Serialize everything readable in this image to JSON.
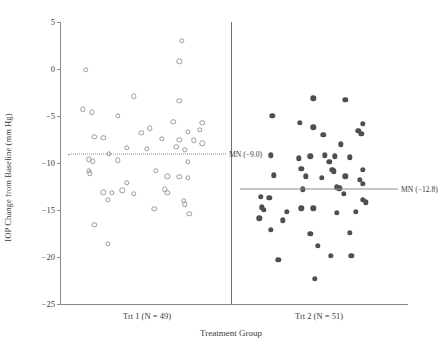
{
  "chart_data": {
    "type": "scatter",
    "title": "",
    "xlabel": "Treatment Group",
    "ylabel": "IOP Change from Baseline (mm Hg)",
    "ylim": [
      -25,
      5
    ],
    "yticks": [
      5,
      0,
      -5,
      -10,
      -15,
      -20,
      -25
    ],
    "ytick_labels": [
      "5",
      "0",
      "−5",
      "−10",
      "−15",
      "−20",
      "−25"
    ],
    "grid": false,
    "legend_position": "none",
    "groups": [
      {
        "name": "Trt 1",
        "label": "Trt 1 (N = 49)",
        "n": 49,
        "marker": "open-circle",
        "marker_color": "#9a9a9a",
        "mean": -9.0,
        "mean_label": "MN (−9.0)",
        "mean_line_style": "dotted",
        "points": [
          {
            "jitter": 0.74,
            "y": 3.0
          },
          {
            "jitter": 0.72,
            "y": 0.8
          },
          {
            "jitter": 0.08,
            "y": -0.1
          },
          {
            "jitter": 0.41,
            "y": -2.9
          },
          {
            "jitter": 0.72,
            "y": -3.4
          },
          {
            "jitter": 0.06,
            "y": -4.3
          },
          {
            "jitter": 0.12,
            "y": -4.6
          },
          {
            "jitter": 0.3,
            "y": -5.0
          },
          {
            "jitter": 0.68,
            "y": -5.6
          },
          {
            "jitter": 0.88,
            "y": -5.7
          },
          {
            "jitter": 0.52,
            "y": -6.3
          },
          {
            "jitter": 0.46,
            "y": -6.8
          },
          {
            "jitter": 0.78,
            "y": -6.7
          },
          {
            "jitter": 0.86,
            "y": -6.5
          },
          {
            "jitter": 0.14,
            "y": -7.2
          },
          {
            "jitter": 0.2,
            "y": -7.3
          },
          {
            "jitter": 0.6,
            "y": -7.4
          },
          {
            "jitter": 0.72,
            "y": -7.5
          },
          {
            "jitter": 0.82,
            "y": -7.6
          },
          {
            "jitter": 0.88,
            "y": -7.9
          },
          {
            "jitter": 0.36,
            "y": -8.4
          },
          {
            "jitter": 0.5,
            "y": -8.5
          },
          {
            "jitter": 0.7,
            "y": -8.3
          },
          {
            "jitter": 0.76,
            "y": -8.6
          },
          {
            "jitter": 0.24,
            "y": -9.0
          },
          {
            "jitter": 0.1,
            "y": -9.6
          },
          {
            "jitter": 0.13,
            "y": -9.8
          },
          {
            "jitter": 0.3,
            "y": -9.7
          },
          {
            "jitter": 0.78,
            "y": -9.9
          },
          {
            "jitter": 0.1,
            "y": -10.8
          },
          {
            "jitter": 0.11,
            "y": -11.1
          },
          {
            "jitter": 0.56,
            "y": -10.8
          },
          {
            "jitter": 0.64,
            "y": -11.4
          },
          {
            "jitter": 0.72,
            "y": -11.5
          },
          {
            "jitter": 0.78,
            "y": -11.6
          },
          {
            "jitter": 0.36,
            "y": -12.1
          },
          {
            "jitter": 0.33,
            "y": -12.9
          },
          {
            "jitter": 0.62,
            "y": -12.8
          },
          {
            "jitter": 0.64,
            "y": -13.2
          },
          {
            "jitter": 0.2,
            "y": -13.1
          },
          {
            "jitter": 0.26,
            "y": -13.2
          },
          {
            "jitter": 0.41,
            "y": -13.3
          },
          {
            "jitter": 0.23,
            "y": -13.9
          },
          {
            "jitter": 0.55,
            "y": -14.9
          },
          {
            "jitter": 0.79,
            "y": -15.4
          },
          {
            "jitter": 0.75,
            "y": -14.0
          },
          {
            "jitter": 0.76,
            "y": -14.4
          },
          {
            "jitter": 0.14,
            "y": -16.6
          },
          {
            "jitter": 0.23,
            "y": -18.6
          }
        ]
      },
      {
        "name": "Trt 2",
        "label": "Trt 2 (N = 51)",
        "n": 51,
        "marker": "filled-circle",
        "marker_color": "#4f4f4f",
        "mean": -12.8,
        "mean_label": "MN (−12.8)",
        "mean_line_style": "solid",
        "points": [
          {
            "jitter": 0.46,
            "y": -3.1
          },
          {
            "jitter": 0.68,
            "y": -3.3
          },
          {
            "jitter": 0.18,
            "y": -5.0
          },
          {
            "jitter": 0.37,
            "y": -5.7
          },
          {
            "jitter": 0.8,
            "y": -5.8
          },
          {
            "jitter": 0.46,
            "y": -6.2
          },
          {
            "jitter": 0.77,
            "y": -6.6
          },
          {
            "jitter": 0.53,
            "y": -7.0
          },
          {
            "jitter": 0.79,
            "y": -6.9
          },
          {
            "jitter": 0.65,
            "y": -8.0
          },
          {
            "jitter": 0.17,
            "y": -9.2
          },
          {
            "jitter": 0.44,
            "y": -9.3
          },
          {
            "jitter": 0.54,
            "y": -9.2
          },
          {
            "jitter": 0.36,
            "y": -9.5
          },
          {
            "jitter": 0.61,
            "y": -9.3
          },
          {
            "jitter": 0.71,
            "y": -9.4
          },
          {
            "jitter": 0.57,
            "y": -9.9
          },
          {
            "jitter": 0.38,
            "y": -10.6
          },
          {
            "jitter": 0.59,
            "y": -10.7
          },
          {
            "jitter": 0.6,
            "y": -10.9
          },
          {
            "jitter": 0.8,
            "y": -10.7
          },
          {
            "jitter": 0.19,
            "y": -11.3
          },
          {
            "jitter": 0.41,
            "y": -11.4
          },
          {
            "jitter": 0.52,
            "y": -11.6
          },
          {
            "jitter": 0.68,
            "y": -11.4
          },
          {
            "jitter": 0.78,
            "y": -11.8
          },
          {
            "jitter": 0.8,
            "y": -12.2
          },
          {
            "jitter": 0.62,
            "y": -12.6
          },
          {
            "jitter": 0.64,
            "y": -12.7
          },
          {
            "jitter": 0.39,
            "y": -12.8
          },
          {
            "jitter": 0.67,
            "y": -13.3
          },
          {
            "jitter": 0.1,
            "y": -13.6
          },
          {
            "jitter": 0.16,
            "y": -13.7
          },
          {
            "jitter": 0.8,
            "y": -13.9
          },
          {
            "jitter": 0.82,
            "y": -14.2
          },
          {
            "jitter": 0.11,
            "y": -14.7
          },
          {
            "jitter": 0.12,
            "y": -15.0
          },
          {
            "jitter": 0.38,
            "y": -14.8
          },
          {
            "jitter": 0.46,
            "y": -14.8
          },
          {
            "jitter": 0.28,
            "y": -15.2
          },
          {
            "jitter": 0.62,
            "y": -15.3
          },
          {
            "jitter": 0.75,
            "y": -15.2
          },
          {
            "jitter": 0.09,
            "y": -15.9
          },
          {
            "jitter": 0.25,
            "y": -16.1
          },
          {
            "jitter": 0.17,
            "y": -17.1
          },
          {
            "jitter": 0.44,
            "y": -17.5
          },
          {
            "jitter": 0.71,
            "y": -17.4
          },
          {
            "jitter": 0.49,
            "y": -18.8
          },
          {
            "jitter": 0.58,
            "y": -19.9
          },
          {
            "jitter": 0.72,
            "y": -19.9
          },
          {
            "jitter": 0.22,
            "y": -20.3
          },
          {
            "jitter": 0.47,
            "y": -22.3
          }
        ]
      }
    ]
  }
}
